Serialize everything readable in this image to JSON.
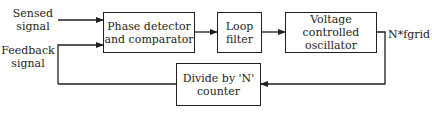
{
  "diagram": {
    "inputs": {
      "sensed_signal": [
        "Sensed",
        "signal"
      ],
      "feedback_signal": [
        "Feedback",
        "signal"
      ]
    },
    "blocks": {
      "phase_detector": [
        "Phase detector",
        "and comparator"
      ],
      "loop_filter": [
        "Loop",
        "filter"
      ],
      "vco": [
        "Voltage",
        "controlled",
        "oscillator"
      ],
      "divider": [
        "Divide by 'N'",
        "counter"
      ]
    },
    "output_label": "N*fgrid",
    "colors": {
      "line": "#231f20",
      "background": "#ffffff"
    }
  }
}
